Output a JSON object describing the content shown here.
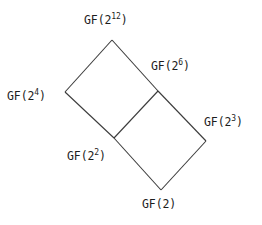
{
  "diagram": {
    "kind": "subfield-lattice",
    "stroke_color": "#3b3b3b",
    "background_color": "#ffffff",
    "text_color": "#1d1d1d",
    "nodes": [
      {
        "id": "gf2_12",
        "base": "GF(2",
        "exponent": "12",
        "close": ")",
        "x": 112,
        "y": 40
      },
      {
        "id": "gf2_6",
        "base": "GF(2",
        "exponent": "6",
        "close": ")",
        "x": 158,
        "y": 91
      },
      {
        "id": "gf2_4",
        "base": "GF(2",
        "exponent": "4",
        "close": ")",
        "x": 65,
        "y": 92
      },
      {
        "id": "gf2_3",
        "base": "GF(2",
        "exponent": "3",
        "close": ")",
        "x": 206,
        "y": 141
      },
      {
        "id": "gf2_2",
        "base": "GF(2",
        "exponent": "2",
        "close": ")",
        "x": 114,
        "y": 138
      },
      {
        "id": "gf2",
        "base": "GF(2",
        "exponent": "",
        "close": ")",
        "x": 161,
        "y": 190
      }
    ],
    "edges": [
      {
        "from": "gf2_12",
        "to": "gf2_4",
        "x1": 112,
        "y1": 40,
        "x2": 65,
        "y2": 92
      },
      {
        "from": "gf2_12",
        "to": "gf2_6",
        "x1": 112,
        "y1": 40,
        "x2": 158,
        "y2": 91
      },
      {
        "from": "gf2_4",
        "to": "gf2_2",
        "x1": 65,
        "y1": 92,
        "x2": 114,
        "y2": 138
      },
      {
        "from": "gf2_6",
        "to": "gf2_2",
        "x1": 158,
        "y1": 91,
        "x2": 114,
        "y2": 138
      },
      {
        "from": "gf2_6",
        "to": "gf2_3",
        "x1": 158,
        "y1": 91,
        "x2": 206,
        "y2": 141
      },
      {
        "from": "gf2_2",
        "to": "gf2",
        "x1": 114,
        "y1": 138,
        "x2": 161,
        "y2": 190
      },
      {
        "from": "gf2_3",
        "to": "gf2",
        "x1": 206,
        "y1": 141,
        "x2": 161,
        "y2": 190
      }
    ]
  }
}
